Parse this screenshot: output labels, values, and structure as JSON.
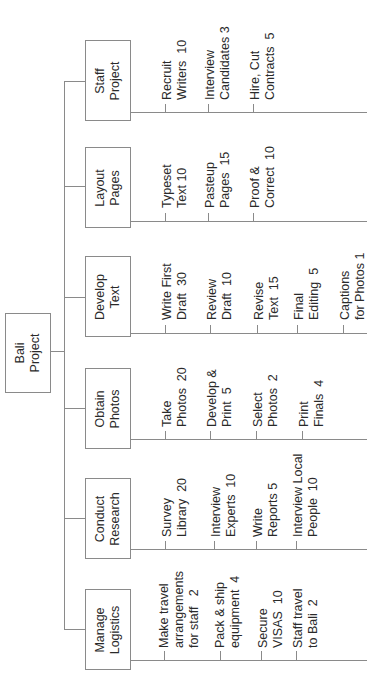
{
  "root": {
    "label": "Bali\nProject"
  },
  "categories": [
    {
      "label": "Staff\nProject",
      "tasks": [
        "Recruit\nWriters  10",
        "Interview\nCandidates 3",
        "Hire, Cut\nContracts  5"
      ]
    },
    {
      "label": "Layout\nPages",
      "tasks": [
        "Typeset\nText 10",
        "Pasteup\nPages  15",
        "Proof &\nCorrect  10"
      ]
    },
    {
      "label": "Develop\nText",
      "tasks": [
        "Write First\nDraft  30",
        "Review\nDraft  10",
        "Revise\nText  15",
        "Final\nEditing  5",
        "Captions\nfor Photos 1"
      ]
    },
    {
      "label": "Obtain\nPhotos",
      "tasks": [
        "Take\nPhotos  20",
        "Develop &\nPrint  5",
        "Select\nPhotos  2",
        "Print\nFinals  4"
      ]
    },
    {
      "label": "Conduct\nResearch",
      "tasks": [
        "Survey\nLibrary  20",
        "Interview\nExperts  10",
        "Write\nReports 5",
        "Interview Local\nPeople  10"
      ]
    },
    {
      "label": "Manage\nLogistics",
      "tasks": [
        "Make travel\narrangements\nfor staff   2",
        "Pack & ship\nequipment  4",
        "Secure\nVISAS  10",
        "Staff travel\nto Bali  2"
      ]
    }
  ]
}
